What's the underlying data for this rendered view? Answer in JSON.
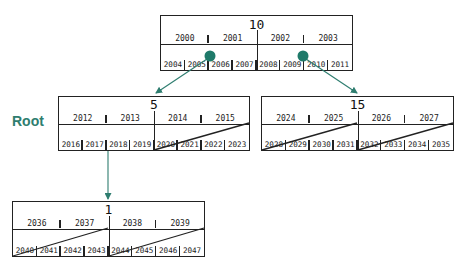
{
  "colors": {
    "accent": "#2e7d6f",
    "line": "#222222"
  },
  "labels": {
    "root": "Root"
  },
  "nodes": {
    "top": {
      "title": "10",
      "keys": [
        "2000",
        "2001",
        "2002",
        "2003"
      ],
      "pointers": [
        "2004",
        "2005",
        "2006",
        "2007",
        "2008",
        "2009",
        "2010",
        "2011"
      ]
    },
    "left": {
      "title": "5",
      "keys": [
        "2012",
        "2013",
        "2014",
        "2015"
      ],
      "pointers": [
        "2016",
        "2017",
        "2018",
        "2019",
        "2020",
        "2021",
        "2022",
        "2023"
      ]
    },
    "right": {
      "title": "15",
      "keys": [
        "2024",
        "2025",
        "2026",
        "2027"
      ],
      "pointers": [
        "2028",
        "2029",
        "2030",
        "2031",
        "2032",
        "2033",
        "2034",
        "2035"
      ]
    },
    "bottom": {
      "title": "1",
      "keys": [
        "2036",
        "2037",
        "2038",
        "2039"
      ],
      "pointers": [
        "2040",
        "2041",
        "2042",
        "2043",
        "2044",
        "2045",
        "2046",
        "2047"
      ]
    }
  }
}
